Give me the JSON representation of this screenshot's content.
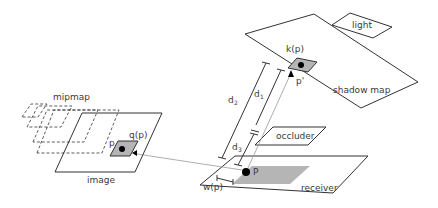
{
  "labels": {
    "light": "light",
    "k_p": "k(p)",
    "p_prime": "p'",
    "shadow_map": "shadow map",
    "d2": "d",
    "d2_sub": "2",
    "d1": "d",
    "d1_sub": "1",
    "d3": "d",
    "d3_sub": "3",
    "occluder": "occluder",
    "mipmap": "mipmap",
    "q_p": "q(p)",
    "p_image": "p",
    "image": "image",
    "P": "P",
    "w_p": "w(p)",
    "receiver": "receiver"
  },
  "colors": {
    "line": "#333333",
    "thin_line": "#888888",
    "fill_gray": "#b5b5b5",
    "dot": "#000000"
  }
}
